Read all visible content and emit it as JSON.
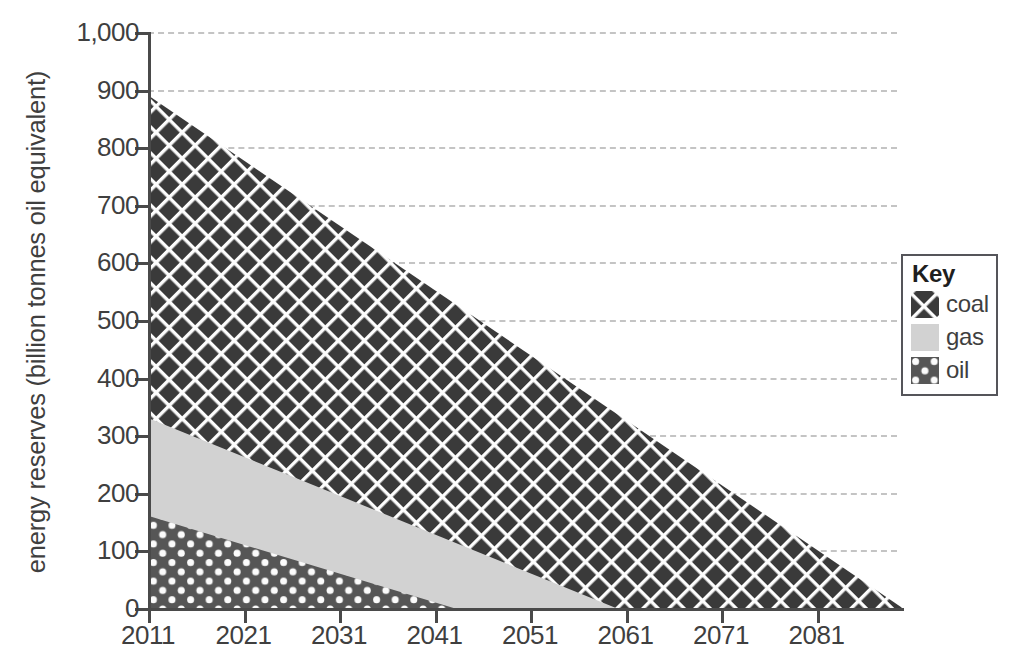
{
  "chart_data": {
    "type": "area",
    "title": "",
    "xlabel": "",
    "ylabel": "energy reserves (billion tonnes oil equivalent)",
    "xlim": [
      2011,
      2090
    ],
    "ylim": [
      0,
      1000
    ],
    "grid": true,
    "stacked": true,
    "legend_position": "right",
    "x_tick_labels": [
      "2011",
      "2021",
      "2031",
      "2041",
      "2051",
      "2061",
      "2071",
      "2081"
    ],
    "x_ticks": [
      2011,
      2021,
      2031,
      2041,
      2051,
      2061,
      2071,
      2081
    ],
    "y_tick_labels": [
      "0",
      "100",
      "200",
      "300",
      "400",
      "500",
      "600",
      "700",
      "800",
      "900",
      "1,000"
    ],
    "y_ticks": [
      0,
      100,
      200,
      300,
      400,
      500,
      600,
      700,
      800,
      900,
      1000
    ],
    "series": [
      {
        "name": "oil",
        "pattern": "dots",
        "color": "#565656",
        "x": [
          2011,
          2043
        ],
        "values": [
          160,
          0
        ],
        "note": "bottom band of stack; depletes to zero in 2043"
      },
      {
        "name": "gas",
        "pattern": "solid-light",
        "color": "#d2d2d2",
        "x": [
          2011,
          2060
        ],
        "values": [
          170,
          0
        ],
        "cumulative_top": [
          330,
          0
        ],
        "note": "middle band of stack; cumulative top falls 330 to 0 by 2060"
      },
      {
        "name": "coal",
        "pattern": "crosshatch",
        "color": "#3a3a3a",
        "x": [
          2011,
          2090
        ],
        "values": [
          560,
          0
        ],
        "cumulative_top": [
          890,
          0
        ],
        "note": "top band of stack; total reserves fall from 890 in 2011 to 0 in 2090"
      }
    ],
    "totals": {
      "x": [
        2011,
        2090
      ],
      "values": [
        890,
        0
      ]
    }
  },
  "legend": {
    "title": "Key",
    "items": [
      {
        "label": "coal",
        "swatch": "crosshatch-swatch"
      },
      {
        "label": "gas",
        "swatch": "light-gray-swatch"
      },
      {
        "label": "oil",
        "swatch": "dotted-swatch"
      }
    ]
  },
  "colors": {
    "coal": "#3a3a3a",
    "gas": "#d2d2d2",
    "oil": "#565656",
    "axis": "#4a4a4a",
    "grid": "#c4c4c4",
    "text": "#3f3f3f",
    "background": "#ffffff"
  }
}
